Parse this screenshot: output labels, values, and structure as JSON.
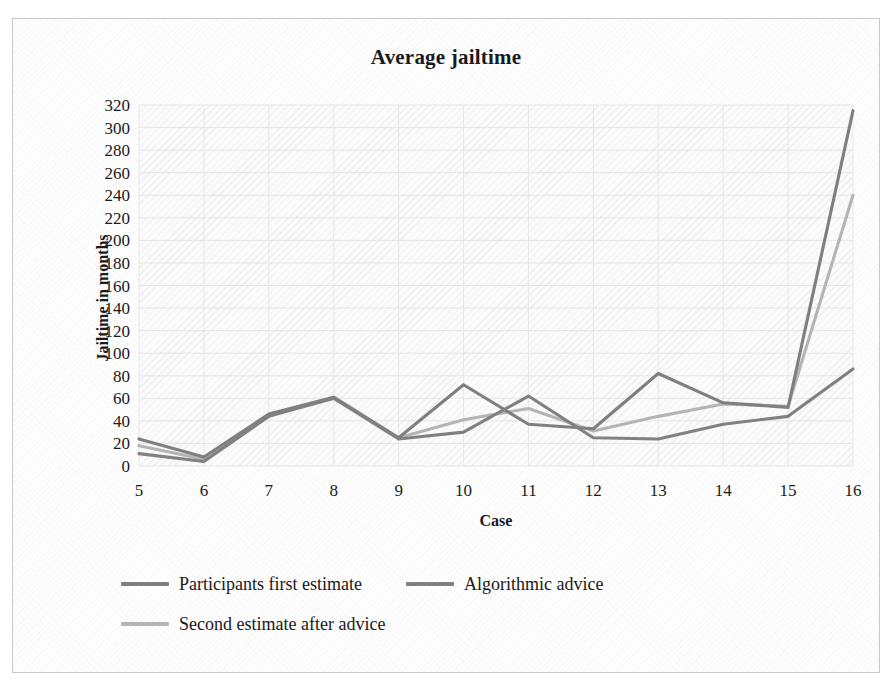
{
  "chart_data": {
    "type": "line",
    "title": "Average jailtime",
    "xlabel": "Case",
    "ylabel": "Jailtime in months",
    "categories": [
      "5",
      "6",
      "7",
      "8",
      "9",
      "10",
      "11",
      "12",
      "13",
      "14",
      "15",
      "16"
    ],
    "x": [
      5,
      6,
      7,
      8,
      9,
      10,
      11,
      12,
      13,
      14,
      15,
      16
    ],
    "xlim": [
      5,
      16
    ],
    "ylim": [
      0,
      320
    ],
    "y_ticks": [
      320,
      300,
      280,
      260,
      240,
      220,
      200,
      180,
      160,
      140,
      120,
      100,
      80,
      60,
      40,
      20,
      0
    ],
    "y_tick_step": 20,
    "grid": true,
    "legend_position": "bottom",
    "series": [
      {
        "name": "Participants first estimate",
        "color": "#7f7f7f",
        "values": [
          24,
          8,
          46,
          61,
          25,
          72,
          37,
          33,
          82,
          56,
          52,
          315
        ]
      },
      {
        "name": "Algorithmic advice",
        "color": "#808080",
        "values": [
          11,
          4,
          44,
          60,
          24,
          30,
          62,
          25,
          24,
          37,
          44,
          86
        ]
      },
      {
        "name": "Second estimate after advice",
        "color": "#b4b4b4",
        "values": [
          18,
          6,
          45,
          60,
          25,
          41,
          51,
          31,
          44,
          55,
          53,
          240
        ]
      }
    ]
  },
  "frame": {
    "border_color": "#c9c9c9",
    "plot_background": "#fbfbfb",
    "gridline_color": "#e3e3e3"
  }
}
